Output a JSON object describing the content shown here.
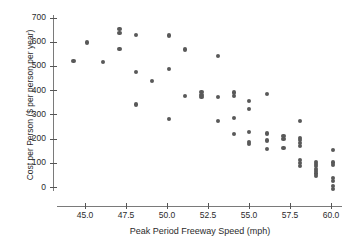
{
  "chart_data": {
    "type": "scatter",
    "title": "",
    "xlabel": "Peak Period Freeway Speed (mph)",
    "ylabel": "Cost per Person ($ per person per year)",
    "xlim": [
      43.0,
      61.0
    ],
    "ylim": [
      -30,
      720
    ],
    "xticks": [
      "45.0",
      "47.5",
      "50.0",
      "52.5",
      "55.0",
      "57.5",
      "60.0"
    ],
    "xtick_values": [
      45.0,
      47.5,
      50.0,
      52.5,
      55.0,
      57.5,
      60.0
    ],
    "yticks": [
      "0",
      "100",
      "200",
      "300",
      "400",
      "500",
      "600",
      "700"
    ],
    "ytick_values": [
      0,
      100,
      200,
      300,
      400,
      500,
      600,
      700
    ],
    "grid": false,
    "legend": null,
    "marker_color": "#595959",
    "axis_color": "#7a7a7a",
    "points": [
      {
        "x": 44.3,
        "y": 522
      },
      {
        "x": 45.1,
        "y": 597
      },
      {
        "x": 46.1,
        "y": 516
      },
      {
        "x": 47.1,
        "y": 652
      },
      {
        "x": 47.1,
        "y": 635
      },
      {
        "x": 47.1,
        "y": 570
      },
      {
        "x": 48.1,
        "y": 628
      },
      {
        "x": 48.1,
        "y": 475
      },
      {
        "x": 48.1,
        "y": 341
      },
      {
        "x": 49.1,
        "y": 438
      },
      {
        "x": 50.1,
        "y": 626
      },
      {
        "x": 50.1,
        "y": 489
      },
      {
        "x": 50.1,
        "y": 280
      },
      {
        "x": 51.1,
        "y": 568
      },
      {
        "x": 51.1,
        "y": 376
      },
      {
        "x": 52.1,
        "y": 392
      },
      {
        "x": 52.1,
        "y": 381
      },
      {
        "x": 52.1,
        "y": 372
      },
      {
        "x": 53.1,
        "y": 542
      },
      {
        "x": 53.1,
        "y": 373
      },
      {
        "x": 53.1,
        "y": 274
      },
      {
        "x": 54.1,
        "y": 390
      },
      {
        "x": 54.1,
        "y": 377
      },
      {
        "x": 54.1,
        "y": 284
      },
      {
        "x": 54.1,
        "y": 218
      },
      {
        "x": 55.0,
        "y": 355
      },
      {
        "x": 55.0,
        "y": 321
      },
      {
        "x": 55.0,
        "y": 228
      },
      {
        "x": 55.0,
        "y": 186
      },
      {
        "x": 55.0,
        "y": 178
      },
      {
        "x": 56.1,
        "y": 385
      },
      {
        "x": 56.1,
        "y": 221
      },
      {
        "x": 56.1,
        "y": 192
      },
      {
        "x": 56.1,
        "y": 157
      },
      {
        "x": 57.1,
        "y": 209
      },
      {
        "x": 57.1,
        "y": 199
      },
      {
        "x": 57.1,
        "y": 161
      },
      {
        "x": 58.1,
        "y": 274
      },
      {
        "x": 58.1,
        "y": 204
      },
      {
        "x": 58.1,
        "y": 193
      },
      {
        "x": 58.1,
        "y": 182
      },
      {
        "x": 58.1,
        "y": 170
      },
      {
        "x": 58.1,
        "y": 112
      },
      {
        "x": 58.1,
        "y": 100
      },
      {
        "x": 58.1,
        "y": 88
      },
      {
        "x": 59.1,
        "y": 104
      },
      {
        "x": 59.1,
        "y": 95
      },
      {
        "x": 59.1,
        "y": 86
      },
      {
        "x": 59.1,
        "y": 76
      },
      {
        "x": 59.1,
        "y": 66
      },
      {
        "x": 59.1,
        "y": 56
      },
      {
        "x": 59.1,
        "y": 46
      },
      {
        "x": 60.1,
        "y": 154
      },
      {
        "x": 60.1,
        "y": 101
      },
      {
        "x": 60.1,
        "y": 92
      },
      {
        "x": 60.1,
        "y": 36
      },
      {
        "x": 60.1,
        "y": 24
      },
      {
        "x": 60.1,
        "y": 5
      },
      {
        "x": 60.1,
        "y": -8
      }
    ]
  },
  "figure": {
    "cropped_title_text": ""
  }
}
